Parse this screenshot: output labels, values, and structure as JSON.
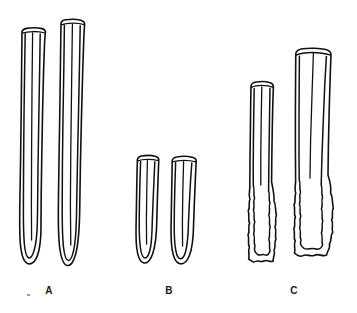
{
  "figure": {
    "background_color": "#ffffff",
    "ink_color": "#111111",
    "width": 357,
    "height": 313,
    "style": "scientific line drawing, double-contour outlines"
  },
  "groups": [
    {
      "id": "A",
      "label": "A",
      "label_x": 38,
      "label_y": 289,
      "description": "Two long slender tubes with flat-cut tops and smooth rounded U-shaped closed bases",
      "specimen_count": 2,
      "relative_length": "longest",
      "base_form": "smooth rounded U",
      "apex_form": "flat truncate"
    },
    {
      "id": "B",
      "label": "B",
      "label_x": 158,
      "label_y": 289,
      "description": "Two short stubby tubes with flat tops and smooth rounded U-shaped bases",
      "specimen_count": 2,
      "relative_length": "shortest",
      "base_form": "smooth rounded U",
      "apex_form": "flat truncate"
    },
    {
      "id": "C",
      "label": "C",
      "label_x": 283,
      "label_y": 289,
      "description": "Two tubes of unequal length with smooth upper shafts and irregular crenulate ragged lower ends",
      "specimen_count": 2,
      "relative_length": "intermediate to long",
      "base_form": "irregular crenulate / ragged",
      "apex_form": "flat truncate rounded"
    }
  ],
  "specimens": [
    {
      "group": "A",
      "index": 1,
      "apex_y": 28,
      "base_y": 264,
      "left_x": 20,
      "right_x": 46
    },
    {
      "group": "A",
      "index": 2,
      "apex_y": 20,
      "base_y": 266,
      "left_x": 56,
      "right_x": 84
    },
    {
      "group": "B",
      "index": 1,
      "apex_y": 156,
      "base_y": 263,
      "left_x": 136,
      "right_x": 159
    },
    {
      "group": "B",
      "index": 2,
      "apex_y": 157,
      "base_y": 264,
      "left_x": 171,
      "right_x": 198
    },
    {
      "group": "C",
      "index": 1,
      "apex_y": 82,
      "base_y": 264,
      "left_x": 249,
      "right_x": 274
    },
    {
      "group": "C",
      "index": 2,
      "apex_y": 49,
      "base_y": 258,
      "left_x": 293,
      "right_x": 331
    }
  ]
}
